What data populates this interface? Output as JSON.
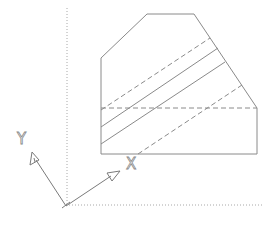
{
  "diagram": {
    "type": "technical-drawing",
    "colors": {
      "background": "#ffffff",
      "line": "#8a8a8a",
      "axis": "#a8a8a8"
    },
    "ucs_icon": {
      "x_label": "X",
      "y_label": "Y"
    },
    "outline_points": [
      [
        101,
        154
      ],
      [
        101,
        58
      ],
      [
        147,
        14
      ],
      [
        194,
        14
      ],
      [
        257,
        108
      ],
      [
        257,
        154
      ]
    ],
    "dashed_horizontal": {
      "y": 108,
      "x1": 101,
      "x2": 257
    },
    "diagonal_lines": [
      {
        "style": "dashed",
        "from": [
          101,
          110
        ],
        "to": [
          210,
          38
        ]
      },
      {
        "style": "solid",
        "from": [
          101,
          127
        ],
        "to": [
          218,
          48
        ]
      },
      {
        "style": "solid",
        "from": [
          101,
          144
        ],
        "to": [
          225,
          62
        ]
      },
      {
        "style": "dashed",
        "from": [
          138,
          154
        ],
        "to": [
          242,
          85
        ]
      }
    ],
    "axes": {
      "vertical_dotted_x": 67,
      "horizontal_dotted_y": 205,
      "origin": [
        66,
        206
      ]
    }
  }
}
